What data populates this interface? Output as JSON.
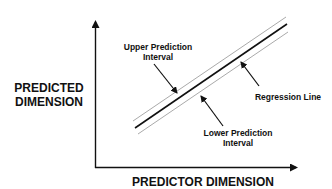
{
  "diagram": {
    "type": "regression-prediction-interval",
    "y_axis_label_line1": "PREDICTED",
    "y_axis_label_line2": "DIMENSION",
    "x_axis_label": "PREDICTOR DIMENSION",
    "annotations": {
      "upper_line1": "Upper Prediction",
      "upper_line2": "Interval",
      "regression": "Regression Line",
      "lower_line1": "Lower Prediction",
      "lower_line2": "Interval"
    },
    "colors": {
      "axis": "#111111",
      "regression_line": "#111111",
      "interval_lines": "#aaaaaa"
    }
  }
}
